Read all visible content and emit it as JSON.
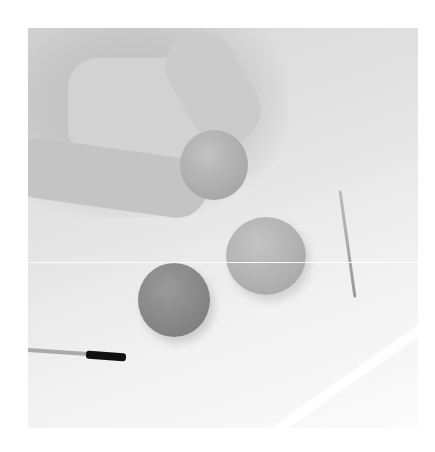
{
  "image": {
    "description": "Grayscale photo of a hand rolling clay balls on a board with a toothpick and a paintbrush",
    "objects": [
      "hand",
      "clay-ball-held",
      "clay-ball-light",
      "clay-ball-dark",
      "toothpick",
      "paintbrush",
      "board-edge"
    ]
  }
}
